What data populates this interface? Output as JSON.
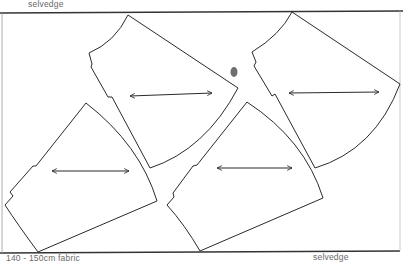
{
  "diagram": {
    "type": "sewing-pattern-layout",
    "labels": {
      "top_selvedge": "selvedge",
      "bottom_selvedge": "selvedge",
      "fabric_width": "140 - 150cm  fabric"
    },
    "colors": {
      "line": "#2a2a2a",
      "label": "#6a6a6a",
      "blot": "#555555",
      "background": "#ffffff"
    },
    "pieces": [
      {
        "id": "piece-1",
        "position": "top-center",
        "grainline": "horizontal-double-arrow"
      },
      {
        "id": "piece-2",
        "position": "top-right",
        "grainline": "horizontal-double-arrow"
      },
      {
        "id": "piece-3",
        "position": "bottom-left",
        "grainline": "horizontal-double-arrow"
      },
      {
        "id": "piece-4",
        "position": "bottom-center",
        "grainline": "horizontal-double-arrow"
      }
    ]
  }
}
